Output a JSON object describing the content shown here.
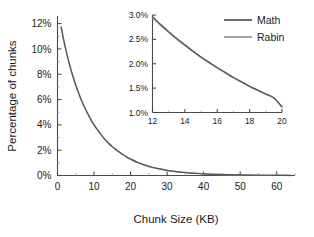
{
  "chart_data": {
    "type": "line",
    "title": "",
    "xlabel": "Chunk Size (KB)",
    "ylabel": "Percentage of chunks",
    "xlim": [
      0,
      65
    ],
    "ylim": [
      0,
      12.6
    ],
    "grid": false,
    "legend_position": "top-right",
    "xticks": [
      "0",
      "10",
      "20",
      "30",
      "40",
      "50",
      "60"
    ],
    "xtick_values": [
      0,
      10,
      20,
      30,
      40,
      50,
      60
    ],
    "yticks": [
      "0%",
      "2%",
      "4%",
      "6%",
      "8%",
      "10%",
      "12%"
    ],
    "ytick_values": [
      0,
      2,
      4,
      6,
      8,
      10,
      12
    ],
    "series": [
      {
        "name": "Math",
        "color": "#555555",
        "x": [
          1,
          2,
          3,
          4,
          5,
          6,
          7,
          8,
          9,
          10,
          11,
          12,
          13,
          14,
          15,
          16,
          17,
          18,
          19,
          20,
          22,
          24,
          26,
          28,
          30,
          32,
          34,
          36,
          38,
          40,
          44,
          48,
          52,
          56,
          60,
          64
        ],
        "values": [
          11.75,
          10.3,
          9.1,
          8.05,
          7.15,
          6.35,
          5.65,
          5.05,
          4.5,
          4.0,
          3.6,
          3.2,
          2.85,
          2.55,
          2.28,
          2.05,
          1.83,
          1.63,
          1.45,
          1.3,
          1.03,
          0.82,
          0.65,
          0.52,
          0.41,
          0.33,
          0.26,
          0.21,
          0.17,
          0.13,
          0.085,
          0.055,
          0.035,
          0.022,
          0.014,
          0.009
        ]
      },
      {
        "name": "Rabin",
        "color": "#8f8f8f",
        "x": [
          1,
          2,
          3,
          4,
          5,
          6,
          7,
          8,
          9,
          10,
          11,
          12,
          13,
          14,
          15,
          16,
          17,
          18,
          19,
          20,
          22,
          24,
          26,
          28,
          30,
          32,
          34,
          36,
          38,
          40,
          44,
          48,
          52,
          56,
          60,
          64
        ],
        "values": [
          11.7,
          10.28,
          9.08,
          8.03,
          7.13,
          6.33,
          5.63,
          5.03,
          4.48,
          3.99,
          3.58,
          3.19,
          2.84,
          2.54,
          2.27,
          2.04,
          1.82,
          1.62,
          1.44,
          1.29,
          1.02,
          0.81,
          0.64,
          0.51,
          0.4,
          0.32,
          0.255,
          0.205,
          0.165,
          0.128,
          0.082,
          0.053,
          0.034,
          0.021,
          0.013,
          0.0085
        ]
      }
    ],
    "legend": [
      "Math",
      "Rabin"
    ],
    "inset": {
      "type": "line",
      "xlabel": "",
      "ylabel": "",
      "xlim": [
        12,
        20
      ],
      "ylim": [
        1.0,
        3.0
      ],
      "grid": false,
      "xticks": [
        "12",
        "14",
        "16",
        "18",
        "20"
      ],
      "xtick_values": [
        12,
        14,
        16,
        18,
        20
      ],
      "yticks": [
        "1.0%",
        "1.5%",
        "2.0%",
        "2.5%",
        "3.0%"
      ],
      "ytick_values": [
        1.0,
        1.5,
        2.0,
        2.5,
        3.0
      ],
      "series": [
        {
          "name": "Math",
          "color": "#555555",
          "x": [
            12,
            12.5,
            13,
            13.5,
            14,
            14.5,
            15,
            15.5,
            16,
            16.5,
            17,
            17.5,
            18,
            18.5,
            19,
            19.5,
            20
          ],
          "values": [
            2.97,
            2.81,
            2.66,
            2.52,
            2.39,
            2.26,
            2.14,
            2.03,
            1.92,
            1.82,
            1.72,
            1.63,
            1.54,
            1.46,
            1.38,
            1.3,
            1.12
          ]
        },
        {
          "name": "Rabin",
          "color": "#8f8f8f",
          "x": [
            12,
            12.5,
            13,
            13.5,
            14,
            14.5,
            15,
            15.5,
            16,
            16.5,
            17,
            17.5,
            18,
            18.5,
            19,
            19.5,
            20
          ],
          "values": [
            2.95,
            2.79,
            2.645,
            2.505,
            2.375,
            2.25,
            2.13,
            2.02,
            1.915,
            1.815,
            1.715,
            1.625,
            1.535,
            1.455,
            1.375,
            1.295,
            1.11
          ]
        }
      ]
    }
  }
}
